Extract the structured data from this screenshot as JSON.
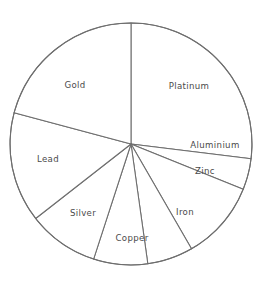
{
  "figure": {
    "background_color": "#ffffff",
    "line_color": "#6e6e6e",
    "label_color": "#4a4a4a"
  },
  "chart_data": {
    "type": "pie",
    "title": "",
    "subtitle": "",
    "xlabel": "",
    "ylabel": "",
    "legend": "none",
    "grid": false,
    "labels_inside_slices": true,
    "start_angle_deg_from_top": 0,
    "direction": "clockwise",
    "center_px": {
      "x": 131,
      "y": 144
    },
    "radius_px": 121,
    "categories": [
      "Platinum",
      "Aluminium",
      "Zinc",
      "Iron",
      "Copper",
      "Silver",
      "Lead",
      "Gold"
    ],
    "values": [
      27.0,
      4.2,
      10.5,
      6.1,
      7.2,
      9.4,
      14.8,
      20.8
    ],
    "unit": "percent",
    "slices": [
      {
        "label": "Platinum",
        "value": 27.0,
        "start_deg": 0,
        "end_deg": 97,
        "label_x": 189,
        "label_y": 86
      },
      {
        "label": "Aluminium",
        "value": 4.2,
        "start_deg": 97,
        "end_deg": 112,
        "label_x": 215,
        "label_y": 145
      },
      {
        "label": "Zinc",
        "value": 10.5,
        "start_deg": 112,
        "end_deg": 150,
        "label_x": 205,
        "label_y": 171
      },
      {
        "label": "Iron",
        "value": 6.1,
        "start_deg": 150,
        "end_deg": 172,
        "label_x": 185,
        "label_y": 212
      },
      {
        "label": "Copper",
        "value": 7.2,
        "start_deg": 172,
        "end_deg": 198,
        "label_x": 132,
        "label_y": 238
      },
      {
        "label": "Silver",
        "value": 9.4,
        "start_deg": 198,
        "end_deg": 232,
        "label_x": 83,
        "label_y": 213
      },
      {
        "label": "Lead",
        "value": 14.8,
        "start_deg": 232,
        "end_deg": 285,
        "label_x": 48,
        "label_y": 159
      },
      {
        "label": "Gold",
        "value": 20.8,
        "start_deg": 285,
        "end_deg": 360,
        "label_x": 75,
        "label_y": 85
      }
    ]
  }
}
